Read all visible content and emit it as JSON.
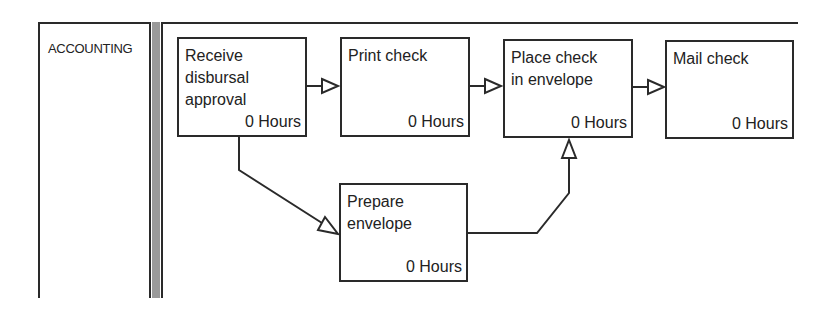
{
  "lane": {
    "label": "ACCOUNTING"
  },
  "tasks": [
    {
      "id": "receive-disbursal-approval",
      "name": "Receive\ndisbursal\napproval",
      "duration": "0 Hours"
    },
    {
      "id": "print-check",
      "name": "Print check",
      "duration": "0 Hours"
    },
    {
      "id": "place-check-in-envelope",
      "name": "Place check\nin envelope",
      "duration": "0 Hours"
    },
    {
      "id": "mail-check",
      "name": "Mail check",
      "duration": "0 Hours"
    },
    {
      "id": "prepare-envelope",
      "name": "Prepare\nenvelope",
      "duration": "0 Hours"
    }
  ],
  "connections": [
    {
      "from": "receive-disbursal-approval",
      "to": "print-check"
    },
    {
      "from": "print-check",
      "to": "place-check-in-envelope"
    },
    {
      "from": "place-check-in-envelope",
      "to": "mail-check"
    },
    {
      "from": "receive-disbursal-approval",
      "to": "prepare-envelope"
    },
    {
      "from": "prepare-envelope",
      "to": "place-check-in-envelope"
    }
  ],
  "colors": {
    "line": "#2a2a2a",
    "separator": "#9a9a9a",
    "background": "#ffffff"
  }
}
